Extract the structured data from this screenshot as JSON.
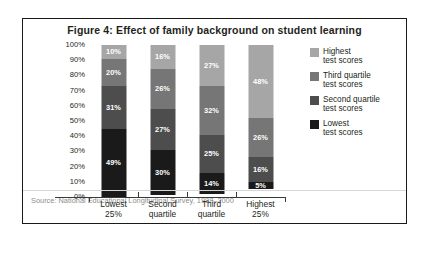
{
  "figure": {
    "title": "Figure 4: Effect of family background on student learning",
    "source": "Source: National Educational Longitudinal Survey, 1988–2000"
  },
  "chart_data": {
    "type": "bar",
    "stacked": true,
    "title": "Figure 4: Effect of family background on student learning",
    "xlabel": "",
    "ylabel": "",
    "ylim": [
      0,
      100
    ],
    "grid": false,
    "legend_position": "right",
    "categories": [
      "Lowest 25%",
      "Second quartile",
      "Third quartile",
      "Highest 25%"
    ],
    "category_lines": [
      [
        "Lowest",
        "25%"
      ],
      [
        "Second",
        "quartile"
      ],
      [
        "Third",
        "quartile"
      ],
      [
        "Highest",
        "25%"
      ]
    ],
    "y_ticks": [
      "100%",
      "90%",
      "80%",
      "70%",
      "60%",
      "50%",
      "40%",
      "30%",
      "20%",
      "10%",
      "0%"
    ],
    "y_tick_values": [
      100,
      90,
      80,
      70,
      60,
      50,
      40,
      30,
      20,
      10,
      0
    ],
    "series": [
      {
        "name": "Highest test scores",
        "name_lines": [
          "Highest",
          "test scores"
        ],
        "color": "#a6a6a6",
        "label_color": "#ffffff",
        "values": [
          10,
          16,
          27,
          48
        ],
        "labels": [
          "10%",
          "16%",
          "27%",
          "48%"
        ]
      },
      {
        "name": "Third quartile test scores",
        "name_lines": [
          "Third quartile",
          "test scores"
        ],
        "color": "#767676",
        "label_color": "#ffffff",
        "values": [
          20,
          26,
          32,
          26
        ],
        "labels": [
          "20%",
          "26%",
          "32%",
          "26%"
        ]
      },
      {
        "name": "Second quartile test scores",
        "name_lines": [
          "Second quartile",
          "test scores"
        ],
        "color": "#4d4d4d",
        "label_color": "#ffffff",
        "values": [
          31,
          27,
          25,
          16
        ],
        "labels": [
          "31%",
          "27%",
          "25%",
          "16%"
        ]
      },
      {
        "name": "Lowest test scores",
        "name_lines": [
          "Lowest",
          "test scores"
        ],
        "color": "#1a1a1a",
        "label_color": "#ffffff",
        "values": [
          49,
          30,
          14,
          5
        ],
        "labels": [
          "49%",
          "30%",
          "14%",
          "5%"
        ]
      }
    ]
  }
}
